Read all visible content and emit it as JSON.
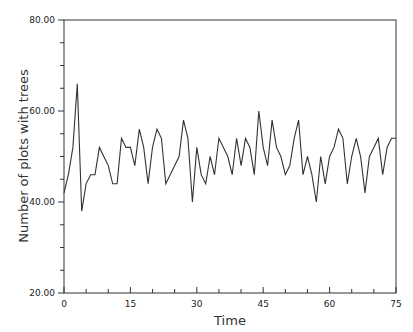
{
  "chart_data": {
    "type": "line",
    "title": "",
    "xlabel": "Time",
    "ylabel": "Number of plots with trees",
    "xlim": [
      0,
      75
    ],
    "ylim": [
      20,
      80
    ],
    "grid": false,
    "legend": null,
    "x_ticks": [
      0,
      15,
      30,
      45,
      60,
      75
    ],
    "x_tick_labels": [
      "0",
      "15",
      "30",
      "45",
      "60",
      "75"
    ],
    "y_ticks": [
      20,
      40,
      60,
      80
    ],
    "y_tick_labels": [
      "20.00",
      "40.00",
      "60.00",
      "80.00"
    ],
    "series": [
      {
        "name": "Number of plots with trees",
        "x": [
          0,
          1,
          2,
          3,
          4,
          5,
          6,
          7,
          8,
          9,
          10,
          11,
          12,
          13,
          14,
          15,
          16,
          17,
          18,
          19,
          20,
          21,
          22,
          23,
          24,
          25,
          26,
          27,
          28,
          29,
          30,
          31,
          32,
          33,
          34,
          35,
          36,
          37,
          38,
          39,
          40,
          41,
          42,
          43,
          44,
          45,
          46,
          47,
          48,
          49,
          50,
          51,
          52,
          53,
          54,
          55,
          56,
          57,
          58,
          59,
          60,
          61,
          62,
          63,
          64,
          65,
          66,
          67,
          68,
          69,
          70,
          71,
          72,
          73,
          74,
          75
        ],
        "values": [
          42,
          46,
          52,
          66,
          38,
          44,
          46,
          46,
          52,
          50,
          48,
          44,
          44,
          54,
          52,
          52,
          48,
          56,
          52,
          44,
          52,
          56,
          54,
          44,
          46,
          48,
          50,
          58,
          54,
          40,
          52,
          46,
          44,
          50,
          46,
          54,
          52,
          50,
          46,
          54,
          48,
          54,
          52,
          46,
          60,
          52,
          48,
          58,
          52,
          50,
          46,
          48,
          54,
          58,
          46,
          50,
          46,
          40,
          50,
          44,
          50,
          52,
          56,
          54,
          44,
          50,
          54,
          50,
          42,
          50,
          52,
          54,
          46,
          52,
          54,
          54
        ]
      }
    ]
  },
  "axes": {
    "x_title": "Time",
    "y_title": "Number of plots with trees"
  }
}
